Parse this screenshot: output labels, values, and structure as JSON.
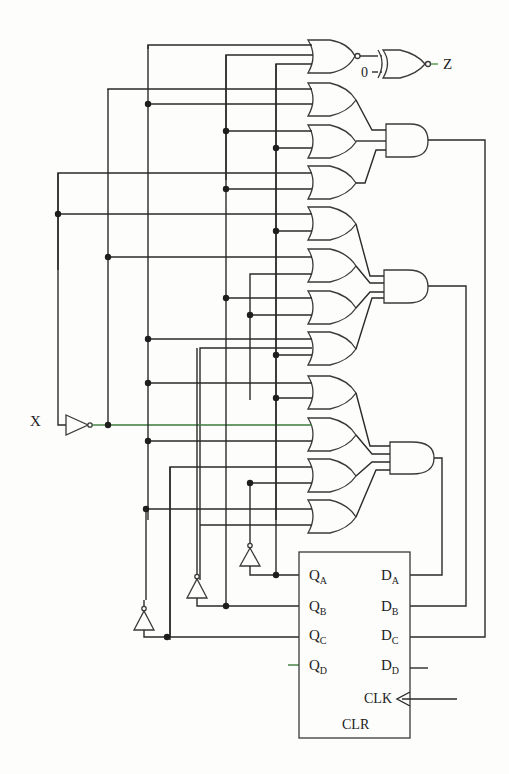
{
  "diagram": {
    "type": "logic-circuit-schematic",
    "input_label": "X",
    "output_label": "Z",
    "constant_input": "0",
    "register": {
      "outputs": [
        {
          "name": "Q",
          "sub": "A"
        },
        {
          "name": "Q",
          "sub": "B"
        },
        {
          "name": "Q",
          "sub": "C"
        },
        {
          "name": "Q",
          "sub": "D"
        }
      ],
      "inputs": [
        {
          "name": "D",
          "sub": "A"
        },
        {
          "name": "D",
          "sub": "B"
        },
        {
          "name": "D",
          "sub": "C"
        },
        {
          "name": "D",
          "sub": "D"
        }
      ],
      "clock_label": "CLK",
      "clear_label": "CLR"
    },
    "gates": {
      "or_groups": 3,
      "ors_per_group": 4,
      "and_gates": 3,
      "final_nor": 1,
      "xnor_output": 1,
      "inverters": 4
    }
  }
}
